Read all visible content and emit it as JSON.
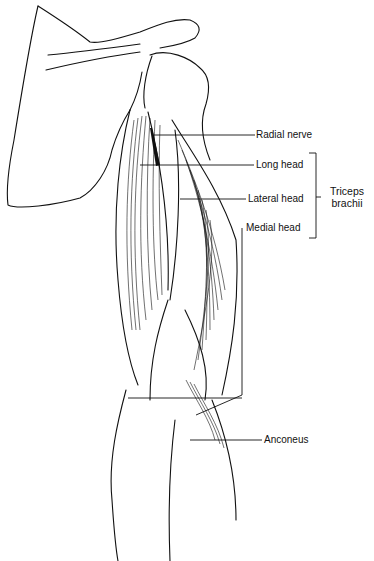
{
  "figure": {
    "labels": [
      {
        "id": "radial-nerve",
        "text": "Radial nerve"
      },
      {
        "id": "long-head",
        "text": "Long head"
      },
      {
        "id": "lateral-head",
        "text": "Lateral head"
      },
      {
        "id": "medial-head",
        "text": "Medial head"
      },
      {
        "id": "anconeus",
        "text": "Anconeus"
      }
    ],
    "group": {
      "line1": "Triceps",
      "line2": "brachii"
    }
  }
}
